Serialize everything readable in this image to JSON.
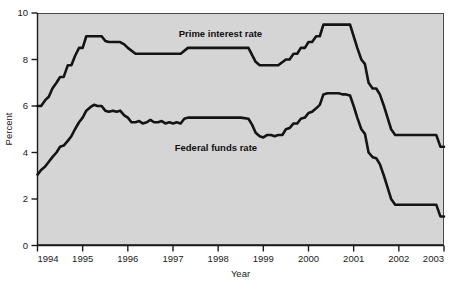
{
  "chart_data": {
    "type": "line",
    "title": "",
    "xlabel": "Year",
    "ylabel": "Percent",
    "xlim": [
      1994,
      2003
    ],
    "ylim": [
      0,
      10
    ],
    "grid": false,
    "legend_position": "inline-annotations",
    "x_ticks": [
      "1994",
      "1995",
      "1996",
      "1997",
      "1998",
      "1999",
      "2000",
      "2001",
      "2002",
      "2003"
    ],
    "y_ticks": [
      "0",
      "2",
      "4",
      "6",
      "8",
      "10"
    ],
    "background_color": "#d5d5d5",
    "line_color": "#141414",
    "annotations": [
      {
        "text": "Prime interest rate",
        "x": 1998.05,
        "y": 8.95
      },
      {
        "text": "Federal funds rate",
        "x": 1997.95,
        "y": 4.05
      }
    ],
    "series": [
      {
        "name": "Prime interest rate",
        "points": [
          [
            1994.0,
            6.0
          ],
          [
            1994.08,
            6.0
          ],
          [
            1994.17,
            6.25
          ],
          [
            1994.25,
            6.4
          ],
          [
            1994.33,
            6.75
          ],
          [
            1994.42,
            7.0
          ],
          [
            1994.5,
            7.25
          ],
          [
            1994.58,
            7.25
          ],
          [
            1994.67,
            7.75
          ],
          [
            1994.75,
            7.75
          ],
          [
            1994.83,
            8.15
          ],
          [
            1994.92,
            8.5
          ],
          [
            1995.0,
            8.5
          ],
          [
            1995.08,
            9.0
          ],
          [
            1995.17,
            9.0
          ],
          [
            1995.25,
            9.0
          ],
          [
            1995.33,
            9.0
          ],
          [
            1995.42,
            9.0
          ],
          [
            1995.5,
            8.8
          ],
          [
            1995.58,
            8.75
          ],
          [
            1995.67,
            8.75
          ],
          [
            1995.75,
            8.75
          ],
          [
            1995.83,
            8.75
          ],
          [
            1995.92,
            8.65
          ],
          [
            1996.0,
            8.5
          ],
          [
            1996.17,
            8.25
          ],
          [
            1996.33,
            8.25
          ],
          [
            1996.5,
            8.25
          ],
          [
            1996.75,
            8.25
          ],
          [
            1997.0,
            8.25
          ],
          [
            1997.17,
            8.25
          ],
          [
            1997.33,
            8.5
          ],
          [
            1997.5,
            8.5
          ],
          [
            1997.75,
            8.5
          ],
          [
            1998.0,
            8.5
          ],
          [
            1998.25,
            8.5
          ],
          [
            1998.5,
            8.5
          ],
          [
            1998.67,
            8.5
          ],
          [
            1998.75,
            8.2
          ],
          [
            1998.83,
            7.9
          ],
          [
            1998.92,
            7.75
          ],
          [
            1999.0,
            7.75
          ],
          [
            1999.17,
            7.75
          ],
          [
            1999.33,
            7.75
          ],
          [
            1999.5,
            8.0
          ],
          [
            1999.58,
            8.0
          ],
          [
            1999.67,
            8.25
          ],
          [
            1999.75,
            8.25
          ],
          [
            1999.83,
            8.5
          ],
          [
            1999.92,
            8.5
          ],
          [
            2000.0,
            8.75
          ],
          [
            2000.08,
            8.75
          ],
          [
            2000.17,
            9.0
          ],
          [
            2000.25,
            9.0
          ],
          [
            2000.33,
            9.5
          ],
          [
            2000.42,
            9.5
          ],
          [
            2000.5,
            9.5
          ],
          [
            2000.58,
            9.5
          ],
          [
            2000.67,
            9.5
          ],
          [
            2000.75,
            9.5
          ],
          [
            2000.83,
            9.5
          ],
          [
            2000.92,
            9.5
          ],
          [
            2001.0,
            9.0
          ],
          [
            2001.08,
            8.5
          ],
          [
            2001.17,
            8.0
          ],
          [
            2001.25,
            7.8
          ],
          [
            2001.33,
            7.0
          ],
          [
            2001.42,
            6.75
          ],
          [
            2001.5,
            6.75
          ],
          [
            2001.58,
            6.5
          ],
          [
            2001.67,
            6.0
          ],
          [
            2001.75,
            5.5
          ],
          [
            2001.83,
            5.0
          ],
          [
            2001.92,
            4.75
          ],
          [
            2002.0,
            4.75
          ],
          [
            2002.17,
            4.75
          ],
          [
            2002.33,
            4.75
          ],
          [
            2002.5,
            4.75
          ],
          [
            2002.67,
            4.75
          ],
          [
            2002.83,
            4.75
          ],
          [
            2002.92,
            4.25
          ],
          [
            2003.0,
            4.25
          ]
        ]
      },
      {
        "name": "Federal funds rate",
        "points": [
          [
            1994.0,
            3.05
          ],
          [
            1994.08,
            3.25
          ],
          [
            1994.17,
            3.4
          ],
          [
            1994.25,
            3.6
          ],
          [
            1994.33,
            3.8
          ],
          [
            1994.42,
            4.0
          ],
          [
            1994.5,
            4.25
          ],
          [
            1994.58,
            4.3
          ],
          [
            1994.67,
            4.5
          ],
          [
            1994.75,
            4.7
          ],
          [
            1994.83,
            5.0
          ],
          [
            1994.92,
            5.3
          ],
          [
            1995.0,
            5.5
          ],
          [
            1995.08,
            5.8
          ],
          [
            1995.17,
            5.95
          ],
          [
            1995.25,
            6.05
          ],
          [
            1995.33,
            6.0
          ],
          [
            1995.42,
            6.0
          ],
          [
            1995.5,
            5.8
          ],
          [
            1995.58,
            5.75
          ],
          [
            1995.67,
            5.8
          ],
          [
            1995.75,
            5.75
          ],
          [
            1995.83,
            5.8
          ],
          [
            1995.92,
            5.6
          ],
          [
            1996.0,
            5.5
          ],
          [
            1996.08,
            5.3
          ],
          [
            1996.17,
            5.3
          ],
          [
            1996.25,
            5.35
          ],
          [
            1996.33,
            5.25
          ],
          [
            1996.42,
            5.3
          ],
          [
            1996.5,
            5.4
          ],
          [
            1996.58,
            5.3
          ],
          [
            1996.67,
            5.3
          ],
          [
            1996.75,
            5.35
          ],
          [
            1996.83,
            5.25
          ],
          [
            1996.92,
            5.3
          ],
          [
            1997.0,
            5.25
          ],
          [
            1997.08,
            5.3
          ],
          [
            1997.17,
            5.25
          ],
          [
            1997.25,
            5.45
          ],
          [
            1997.33,
            5.5
          ],
          [
            1997.42,
            5.5
          ],
          [
            1997.5,
            5.5
          ],
          [
            1997.58,
            5.5
          ],
          [
            1997.67,
            5.5
          ],
          [
            1997.75,
            5.5
          ],
          [
            1997.83,
            5.5
          ],
          [
            1997.92,
            5.5
          ],
          [
            1998.0,
            5.5
          ],
          [
            1998.17,
            5.5
          ],
          [
            1998.33,
            5.5
          ],
          [
            1998.5,
            5.5
          ],
          [
            1998.67,
            5.45
          ],
          [
            1998.75,
            5.2
          ],
          [
            1998.83,
            4.85
          ],
          [
            1998.92,
            4.7
          ],
          [
            1999.0,
            4.65
          ],
          [
            1999.08,
            4.75
          ],
          [
            1999.17,
            4.75
          ],
          [
            1999.25,
            4.7
          ],
          [
            1999.33,
            4.75
          ],
          [
            1999.42,
            4.75
          ],
          [
            1999.5,
            5.0
          ],
          [
            1999.58,
            5.05
          ],
          [
            1999.67,
            5.25
          ],
          [
            1999.75,
            5.25
          ],
          [
            1999.83,
            5.45
          ],
          [
            1999.92,
            5.5
          ],
          [
            2000.0,
            5.7
          ],
          [
            2000.08,
            5.75
          ],
          [
            2000.17,
            5.9
          ],
          [
            2000.25,
            6.05
          ],
          [
            2000.33,
            6.5
          ],
          [
            2000.42,
            6.55
          ],
          [
            2000.5,
            6.55
          ],
          [
            2000.58,
            6.55
          ],
          [
            2000.67,
            6.55
          ],
          [
            2000.75,
            6.5
          ],
          [
            2000.83,
            6.5
          ],
          [
            2000.92,
            6.45
          ],
          [
            2001.0,
            6.0
          ],
          [
            2001.08,
            5.5
          ],
          [
            2001.17,
            5.0
          ],
          [
            2001.25,
            4.8
          ],
          [
            2001.33,
            4.0
          ],
          [
            2001.42,
            3.8
          ],
          [
            2001.5,
            3.75
          ],
          [
            2001.58,
            3.5
          ],
          [
            2001.67,
            3.0
          ],
          [
            2001.75,
            2.5
          ],
          [
            2001.83,
            2.0
          ],
          [
            2001.92,
            1.75
          ],
          [
            2002.0,
            1.75
          ],
          [
            2002.17,
            1.75
          ],
          [
            2002.33,
            1.75
          ],
          [
            2002.5,
            1.75
          ],
          [
            2002.67,
            1.75
          ],
          [
            2002.83,
            1.75
          ],
          [
            2002.92,
            1.25
          ],
          [
            2003.0,
            1.25
          ]
        ]
      }
    ]
  },
  "axes": {
    "y_axis_title": "Percent",
    "x_axis_title": "Year"
  }
}
